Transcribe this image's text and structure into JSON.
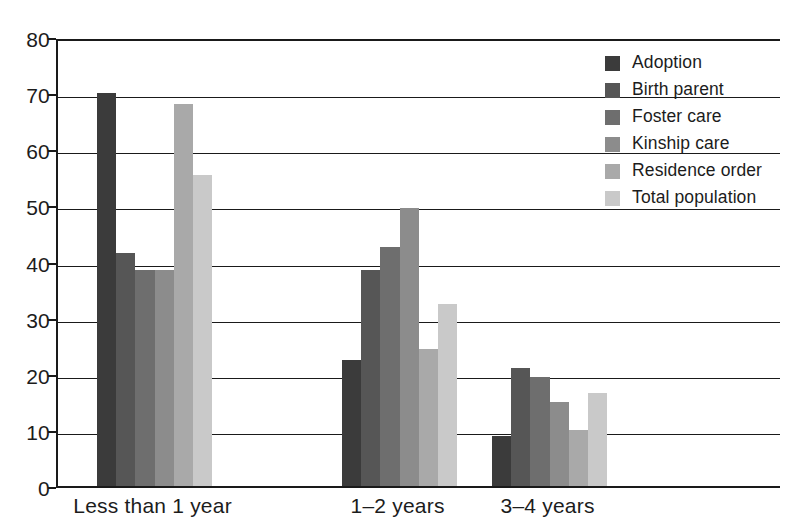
{
  "chart_data": {
    "type": "bar",
    "title": "",
    "subtitle": "",
    "xlabel": "",
    "ylabel": "",
    "ylim": [
      0,
      80
    ],
    "ytick_step": 10,
    "yticks": [
      "0",
      "10",
      "20",
      "30",
      "40",
      "50",
      "60",
      "70",
      "80"
    ],
    "grid": true,
    "legend_position": "top-right-inside",
    "categories": [
      "Less than 1 year",
      "1–2 years",
      "3–4 years"
    ],
    "series": [
      {
        "name": "Adoption",
        "color": "#3b3b3b",
        "values": [
          70.0,
          22.5,
          9.0
        ]
      },
      {
        "name": "Birth parent",
        "color": "#565656",
        "values": [
          41.5,
          38.5,
          21.0
        ]
      },
      {
        "name": "Foster care",
        "color": "#6e6e6e",
        "values": [
          38.5,
          42.5,
          19.5
        ]
      },
      {
        "name": "Kinship care",
        "color": "#8c8c8c",
        "values": [
          38.5,
          49.5,
          15.0
        ]
      },
      {
        "name": "Residence order",
        "color": "#a9a9a9",
        "values": [
          68.0,
          24.5,
          10.0
        ]
      },
      {
        "name": "Total population",
        "color": "#c9c9c9",
        "values": [
          55.5,
          32.5,
          16.5
        ]
      }
    ]
  },
  "legend": {
    "items": [
      {
        "label": "Adoption"
      },
      {
        "label": "Birth parent"
      },
      {
        "label": "Foster care"
      },
      {
        "label": "Kinship care"
      },
      {
        "label": "Residence order"
      },
      {
        "label": "Total population"
      }
    ]
  },
  "axes": {
    "y": {
      "ticks": [
        "80",
        "70",
        "60",
        "50",
        "40",
        "30",
        "20",
        "10",
        "0"
      ]
    },
    "x": {
      "ticks": [
        "Less than 1 year",
        "1–2 years",
        "3–4 years"
      ]
    }
  },
  "colors": {
    "axis": "#1a1a1a",
    "text": "#1c1c1c",
    "background": "#ffffff"
  }
}
